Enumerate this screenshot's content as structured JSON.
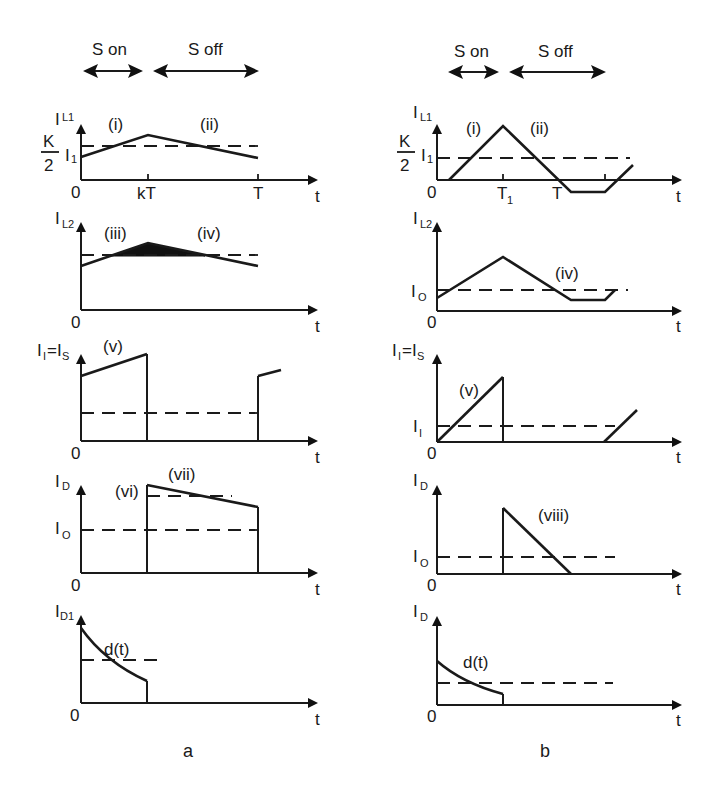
{
  "header": {
    "left": {
      "s_on": "S on",
      "s_off": "S off"
    },
    "right": {
      "s_on": "S on",
      "s_off": "S off"
    }
  },
  "panels": {
    "a": {
      "caption": "a",
      "plots": [
        {
          "ylabel_main": "I",
          "ylabel_sub": "L1",
          "level_main": "I",
          "level_sub": "1",
          "k_num": "K",
          "k_den": "2",
          "origin": "0",
          "xlabel": "t",
          "ticks": [
            "kT",
            "T"
          ],
          "regions": [
            "(i)",
            "(ii)"
          ]
        },
        {
          "ylabel_main": "I",
          "ylabel_sub": "L2",
          "origin": "0",
          "xlabel": "t",
          "regions": [
            "(iii)",
            "(iv)"
          ]
        },
        {
          "ylabel_main": "I",
          "ylabel_sub": "I",
          "ylabel_eq": "=I",
          "ylabel_sub2": "S",
          "origin": "0",
          "xlabel": "t",
          "regions": [
            "(v)"
          ]
        },
        {
          "ylabel_main": "I",
          "ylabel_sub": "D",
          "level_main": "I",
          "level_sub": "O",
          "origin": "0",
          "xlabel": "t",
          "regions": [
            "(vi)",
            "(vii)"
          ]
        },
        {
          "ylabel_main": "I",
          "ylabel_sub": "D1",
          "origin": "0",
          "xlabel": "t",
          "regions": [
            "d(t)"
          ]
        }
      ]
    },
    "b": {
      "caption": "b",
      "plots": [
        {
          "ylabel_main": "I",
          "ylabel_sub": "L1",
          "level_main": "I",
          "level_sub": "1",
          "k_num": "K",
          "k_den": "2",
          "origin": "0",
          "xlabel": "t",
          "ticks": [
            "T",
            "1",
            "T"
          ],
          "regions": [
            "(i)",
            "(ii)"
          ]
        },
        {
          "ylabel_main": "I",
          "ylabel_sub": "L2",
          "level_main": "I",
          "level_sub": "O",
          "origin": "0",
          "xlabel": "t",
          "regions": [
            "(iv)"
          ]
        },
        {
          "ylabel_main": "I",
          "ylabel_sub": "I",
          "ylabel_eq": "=I",
          "ylabel_sub2": "S",
          "level_main": "I",
          "level_sub": "I",
          "origin": "0",
          "xlabel": "t",
          "regions": [
            "(v)"
          ]
        },
        {
          "ylabel_main": "I",
          "ylabel_sub": "D",
          "level_main": "I",
          "level_sub": "O",
          "origin": "0",
          "xlabel": "t",
          "regions": [
            "(viii)"
          ]
        },
        {
          "ylabel_main": "I",
          "ylabel_sub": "D",
          "origin": "0",
          "xlabel": "t",
          "regions": [
            "d(t)"
          ]
        }
      ]
    }
  },
  "colors": {
    "ink": "#1a1a1a",
    "background": "#ffffff"
  }
}
